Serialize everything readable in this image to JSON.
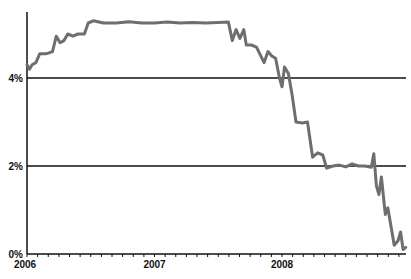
{
  "chart_data": {
    "type": "line",
    "title": "",
    "xlabel": "",
    "ylabel": "",
    "ylim": [
      0,
      5.5
    ],
    "xlim": [
      2006.0,
      2008.98
    ],
    "y_ticks": [
      {
        "value": 0,
        "label": "0%"
      },
      {
        "value": 2,
        "label": "2%"
      },
      {
        "value": 4,
        "label": "4%"
      }
    ],
    "x_ticks": [
      {
        "value": 2006,
        "label": "2006"
      },
      {
        "value": 2007,
        "label": "2007"
      },
      {
        "value": 2008,
        "label": "2008"
      }
    ],
    "grid": "horizontal lines at 2% and 4%",
    "legend": "none",
    "series": [
      {
        "name": "rate",
        "color": "#6e6e6e",
        "x": [
          2006.0,
          2006.02,
          2006.04,
          2006.07,
          2006.1,
          2006.15,
          2006.2,
          2006.23,
          2006.26,
          2006.29,
          2006.32,
          2006.36,
          2006.4,
          2006.45,
          2006.48,
          2006.52,
          2006.6,
          2006.7,
          2006.8,
          2006.9,
          2007.0,
          2007.1,
          2007.2,
          2007.3,
          2007.4,
          2007.5,
          2007.58,
          2007.61,
          2007.64,
          2007.67,
          2007.7,
          2007.72,
          2007.76,
          2007.8,
          2007.86,
          2007.89,
          2007.92,
          2007.95,
          2007.98,
          2008.0,
          2008.02,
          2008.05,
          2008.08,
          2008.11,
          2008.16,
          2008.2,
          2008.24,
          2008.28,
          2008.32,
          2008.35,
          2008.4,
          2008.45,
          2008.5,
          2008.55,
          2008.6,
          2008.65,
          2008.7,
          2008.72,
          2008.74,
          2008.76,
          2008.78,
          2008.81,
          2008.83,
          2008.86,
          2008.88,
          2008.91,
          2008.93,
          2008.95,
          2008.97
        ],
        "values": [
          4.3,
          4.2,
          4.3,
          4.35,
          4.55,
          4.55,
          4.6,
          4.95,
          4.8,
          4.85,
          5.0,
          4.95,
          5.0,
          5.0,
          5.25,
          5.3,
          5.25,
          5.25,
          5.28,
          5.25,
          5.25,
          5.27,
          5.25,
          5.26,
          5.25,
          5.26,
          5.27,
          4.85,
          5.1,
          4.9,
          5.1,
          4.75,
          4.75,
          4.7,
          4.35,
          4.6,
          4.5,
          4.45,
          4.0,
          3.8,
          4.25,
          4.1,
          3.6,
          3.0,
          2.98,
          3.0,
          2.2,
          2.3,
          2.25,
          1.95,
          2.0,
          2.02,
          1.98,
          2.05,
          2.0,
          2.0,
          1.97,
          2.28,
          1.55,
          1.35,
          1.75,
          0.9,
          1.05,
          0.55,
          0.2,
          0.3,
          0.5,
          0.1,
          0.15
        ]
      }
    ]
  }
}
